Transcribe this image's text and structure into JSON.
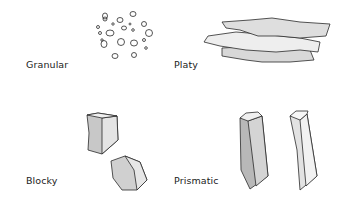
{
  "diagram": {
    "types": [
      {
        "id": "granular",
        "label": "Granular"
      },
      {
        "id": "platy",
        "label": "Platy"
      },
      {
        "id": "blocky",
        "label": "Blocky"
      },
      {
        "id": "prismatic",
        "label": "Prismatic"
      }
    ]
  },
  "colors": {
    "outline": "#2a2a2a",
    "fill_light": "#e6e6e6",
    "fill_mid": "#d2d2d2",
    "fill_dark": "#b8b8b8"
  }
}
